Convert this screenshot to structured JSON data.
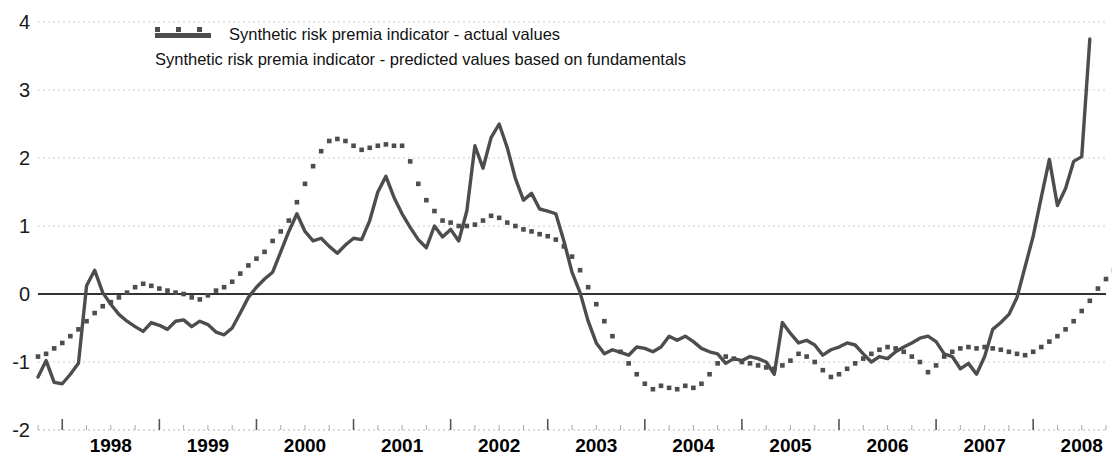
{
  "chart_data": {
    "type": "line",
    "title": "",
    "subtitle": "",
    "xlabel": "",
    "ylabel": "",
    "ylim": [
      -2,
      4
    ],
    "yticks": [
      -2,
      -1,
      0,
      1,
      2,
      3,
      4
    ],
    "ytick_labels": [
      "-2",
      "-1",
      "0",
      "1",
      "2",
      "3",
      "4"
    ],
    "xlim": [
      1997.75,
      2008.75
    ],
    "xticks": [
      1998,
      1999,
      2000,
      2001,
      2002,
      2003,
      2004,
      2005,
      2006,
      2007,
      2008
    ],
    "xtick_labels": [
      "1998",
      "1999",
      "2000",
      "2001",
      "2002",
      "2003",
      "2004",
      "2005",
      "2006",
      "2007",
      "2008"
    ],
    "x_minor_tick_interval": 0.25,
    "grid": true,
    "grid_style": "dotted-horizontal",
    "zero_line": true,
    "legend_position": "top-center",
    "frequency": "monthly",
    "x_start": 1997.75,
    "x_step": 0.0833333,
    "series": [
      {
        "name": "Synthetic risk premia indicator - actual values",
        "style": "solid",
        "color": "#4d4d4d",
        "values": [
          -1.22,
          -0.98,
          -1.3,
          -1.32,
          -1.18,
          -1.02,
          0.12,
          0.35,
          0.02,
          -0.15,
          -0.3,
          -0.4,
          -0.48,
          -0.55,
          -0.42,
          -0.46,
          -0.52,
          -0.4,
          -0.38,
          -0.48,
          -0.4,
          -0.45,
          -0.56,
          -0.6,
          -0.5,
          -0.28,
          -0.05,
          0.1,
          0.22,
          0.32,
          0.62,
          0.92,
          1.18,
          0.92,
          0.78,
          0.82,
          0.7,
          0.6,
          0.72,
          0.82,
          0.8,
          1.08,
          1.5,
          1.73,
          1.42,
          1.18,
          0.98,
          0.8,
          0.68,
          1.0,
          0.84,
          0.95,
          0.78,
          1.22,
          2.18,
          1.85,
          2.3,
          2.5,
          2.15,
          1.7,
          1.38,
          1.48,
          1.25,
          1.22,
          1.18,
          0.78,
          0.32,
          0.02,
          -0.4,
          -0.72,
          -0.88,
          -0.82,
          -0.86,
          -0.9,
          -0.78,
          -0.8,
          -0.85,
          -0.78,
          -0.62,
          -0.68,
          -0.62,
          -0.7,
          -0.8,
          -0.85,
          -0.88,
          -1.02,
          -0.95,
          -0.98,
          -0.92,
          -0.95,
          -1.0,
          -1.18,
          -0.42,
          -0.58,
          -0.72,
          -0.68,
          -0.75,
          -0.9,
          -0.82,
          -0.78,
          -0.72,
          -0.75,
          -0.88,
          -1.0,
          -0.92,
          -0.95,
          -0.85,
          -0.78,
          -0.72,
          -0.65,
          -0.62,
          -0.7,
          -0.88,
          -0.92,
          -1.1,
          -1.02,
          -1.18,
          -0.92,
          -0.52,
          -0.42,
          -0.3,
          -0.05,
          0.4,
          0.85,
          1.42,
          1.98,
          1.3,
          1.55,
          1.95,
          2.02,
          3.75
        ]
      },
      {
        "name": "Synthetic risk premia indicator - predicted values based on fundamentals",
        "style": "dotted",
        "color": "#4d4d4d",
        "values": [
          -0.92,
          -0.88,
          -0.8,
          -0.72,
          -0.62,
          -0.52,
          -0.4,
          -0.28,
          -0.18,
          -0.12,
          -0.05,
          0.02,
          0.1,
          0.15,
          0.12,
          0.08,
          0.05,
          0.02,
          0.0,
          -0.05,
          -0.08,
          -0.02,
          0.05,
          0.1,
          0.18,
          0.3,
          0.42,
          0.52,
          0.62,
          0.78,
          0.92,
          1.08,
          1.35,
          1.62,
          1.88,
          2.1,
          2.25,
          2.28,
          2.25,
          2.18,
          2.12,
          2.15,
          2.18,
          2.2,
          2.18,
          2.18,
          1.95,
          1.62,
          1.38,
          1.22,
          1.08,
          1.05,
          1.0,
          1.0,
          1.02,
          1.08,
          1.15,
          1.12,
          1.05,
          1.0,
          0.95,
          0.92,
          0.88,
          0.85,
          0.8,
          0.7,
          0.55,
          0.35,
          0.1,
          -0.15,
          -0.4,
          -0.62,
          -0.85,
          -1.02,
          -1.18,
          -1.32,
          -1.4,
          -1.35,
          -1.38,
          -1.4,
          -1.35,
          -1.38,
          -1.32,
          -1.18,
          -1.02,
          -0.92,
          -0.95,
          -1.0,
          -1.02,
          -1.05,
          -1.08,
          -1.1,
          -1.05,
          -0.98,
          -0.88,
          -0.92,
          -1.0,
          -1.12,
          -1.22,
          -1.18,
          -1.1,
          -1.02,
          -0.95,
          -0.88,
          -0.82,
          -0.78,
          -0.8,
          -0.85,
          -0.92,
          -1.0,
          -1.15,
          -1.05,
          -0.92,
          -0.85,
          -0.8,
          -0.78,
          -0.8,
          -0.78,
          -0.8,
          -0.82,
          -0.85,
          -0.88,
          -0.9,
          -0.85,
          -0.78,
          -0.7,
          -0.62,
          -0.52,
          -0.4,
          -0.25,
          -0.1,
          0.08,
          0.22,
          0.35,
          0.45
        ]
      }
    ]
  },
  "legend": {
    "items": [
      {
        "label": "Synthetic risk premia indicator - actual values",
        "style": "solid"
      },
      {
        "label": "Synthetic risk premia indicator - predicted values based on fundamentals",
        "style": "dotted"
      }
    ]
  },
  "colors": {
    "line": "#4d4d4d",
    "axis": "#333333",
    "grid": "#cccccc",
    "text": "#111111",
    "background": "#ffffff"
  }
}
